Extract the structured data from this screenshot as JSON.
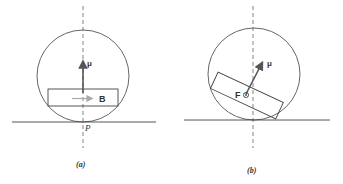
{
  "figure": {
    "panels": [
      {
        "id": "a",
        "caption": "(a)",
        "vector_label": "μ",
        "body_label": "B",
        "contact_point_label": "P"
      },
      {
        "id": "b",
        "caption": "(b)",
        "vector_label": "μ",
        "body_label": "F",
        "field_symbol": "⊗"
      }
    ],
    "colors": {
      "line": "#444444",
      "arrow": "#555555",
      "light_arrow": "#999999"
    }
  }
}
